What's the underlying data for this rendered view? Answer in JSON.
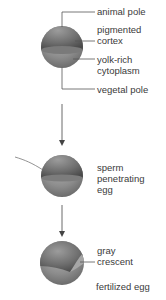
{
  "stage1": {
    "labels": {
      "animal_pole": "animal pole",
      "pigmented_cortex_1": "pigmented",
      "pigmented_cortex_2": "cortex",
      "yolk_rich_1": "yolk-rich",
      "yolk_rich_2": "cytoplasm",
      "vegetal_pole": "vegetal pole"
    }
  },
  "stage2": {
    "labels": {
      "line1": "sperm",
      "line2": "penetrating",
      "line3": "egg"
    }
  },
  "stage3": {
    "labels": {
      "gray_crescent_1": "gray",
      "gray_crescent_2": "crescent",
      "fertilized_egg": "fertilized egg"
    }
  },
  "colors": {
    "sphere_dark": "#5a5a5a",
    "sphere_light": "#9a9a9a",
    "line": "#555555",
    "text": "#3a3a3a"
  }
}
